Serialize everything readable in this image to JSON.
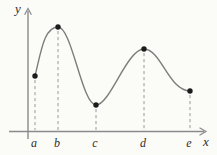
{
  "figure": {
    "background": "#fbfbf8",
    "axis_color": "#8a8a8a",
    "curve_color": "#7d7d7d",
    "dash_color": "#9a9a9a",
    "dot_color": "#1c1c1c",
    "label_color": "#2e2e2e"
  },
  "chart_data": {
    "type": "line",
    "xlabel": "x",
    "ylabel": "y",
    "x_tick_labels": [
      "a",
      "b",
      "c",
      "d",
      "e"
    ],
    "grid": false,
    "legend": false,
    "axes_px": {
      "x_axis_y": 131.5,
      "y_axis_x": 28
    },
    "points": [
      {
        "label": "a",
        "role": "left-endpoint",
        "px": 35,
        "py": 76
      },
      {
        "label": "b",
        "role": "local-maximum",
        "px": 58,
        "py": 27
      },
      {
        "label": "c",
        "role": "local-minimum",
        "px": 96,
        "py": 105
      },
      {
        "label": "d",
        "role": "local-maximum",
        "px": 144,
        "py": 49
      },
      {
        "label": "e",
        "role": "right-endpoint",
        "px": 190,
        "py": 91
      }
    ],
    "curve_path_px": "M 35 76 C 41 52 44 27 58 27 C 72 27 82 105 96 105 C 110 105 127 49 144 49 C 161 49 169 91 190 91"
  }
}
